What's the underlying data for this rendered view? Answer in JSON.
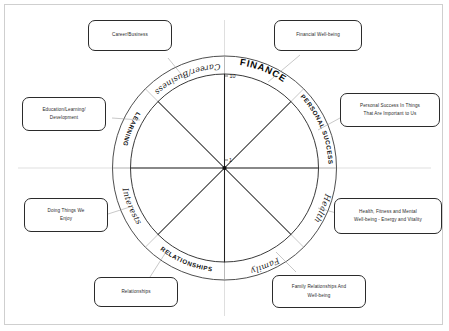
{
  "diagram": {
    "title_labels": {
      "outer_ring": [
        {
          "key": "finance",
          "text": "FINANCE",
          "style": "caps-bold-large"
        },
        {
          "key": "personal_success",
          "text": "PERSONAL SUCCESS",
          "style": "caps-bold"
        },
        {
          "key": "health",
          "text": "Health",
          "style": "script"
        },
        {
          "key": "family",
          "text": "Family",
          "style": "script"
        },
        {
          "key": "relationships",
          "text": "RELATIONSHIPS",
          "style": "caps-bold"
        },
        {
          "key": "interests",
          "text": "Interests",
          "style": "script"
        },
        {
          "key": "learning",
          "text": "LEARNING",
          "style": "caps-bold"
        },
        {
          "key": "career_business",
          "text": "Career/Business",
          "style": "script"
        }
      ]
    },
    "scale": {
      "outer_value": "10",
      "inner_value": "1"
    },
    "callouts": {
      "career_business": [
        "Career/Business"
      ],
      "financial_wellbeing": [
        "Financial Well-being"
      ],
      "education": [
        "Education/Learning/",
        "Development"
      ],
      "personal_success": [
        "Personal Success In Things",
        "That Are Important to Us"
      ],
      "health": [
        "Health, Fitness and Mental",
        "Well-being - Energy and Vitality"
      ],
      "interests": [
        "Doing Things We",
        "Enjoy"
      ],
      "relationships": [
        "Relationships"
      ],
      "family": [
        "Family Relationships And",
        "Well-being"
      ]
    },
    "colors": {
      "ink": "#1c1c1c",
      "ring": "#3a3a3a",
      "page_border": "#cfcfcf",
      "background": "#ffffff"
    }
  }
}
